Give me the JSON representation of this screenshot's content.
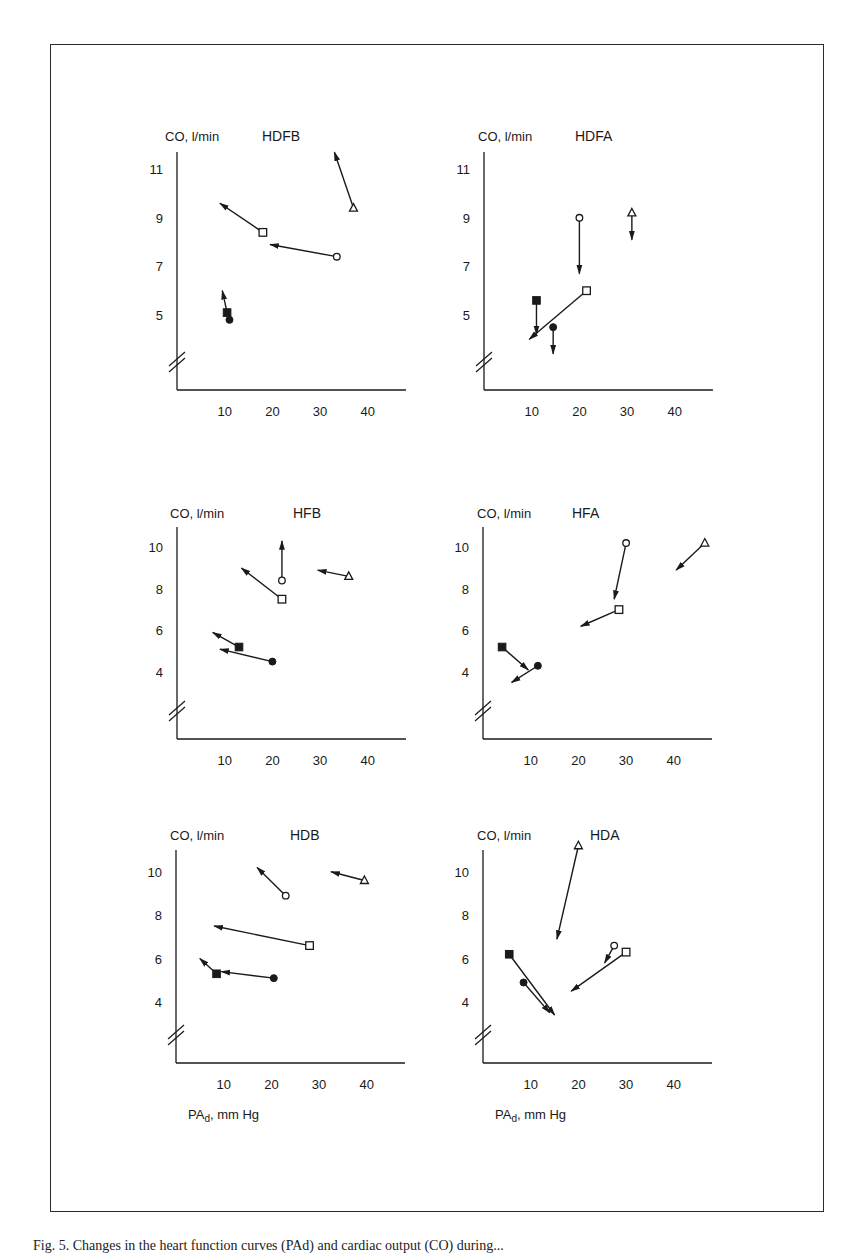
{
  "figure": {
    "caption": "Fig. 5. Changes in the heart function curves (PAd) and cardiac output (CO) during...",
    "y_axis_label": "CO, l/min",
    "x_axis_label": "PAd, mm Hg",
    "x_axis_label_main": "PA",
    "x_axis_label_sub": "d",
    "x_axis_label_unit": ", mm Hg"
  },
  "chart_data": [
    {
      "type": "scatter",
      "title": "HDFB",
      "xlabel": "PAd, mm Hg",
      "ylabel": "CO, l/min",
      "x_ticks": [
        10,
        20,
        30,
        40
      ],
      "y_ticks": [
        5,
        7,
        9,
        11
      ],
      "axis_break": true,
      "series": [
        {
          "marker": "open-triangle",
          "x": 37,
          "y": 9.4,
          "arrow_to": [
            33,
            11.7
          ]
        },
        {
          "marker": "open-square",
          "x": 18,
          "y": 8.4,
          "arrow_to": [
            9,
            9.6
          ]
        },
        {
          "marker": "open-circle",
          "x": 33.5,
          "y": 7.4,
          "arrow_to": [
            19.5,
            7.9
          ]
        },
        {
          "marker": "filled-square",
          "x": 10.5,
          "y": 5.1,
          "arrow_to": [
            9.5,
            6.0
          ]
        },
        {
          "marker": "filled-circle",
          "x": 11,
          "y": 4.8,
          "arrow_to": null
        }
      ]
    },
    {
      "type": "scatter",
      "title": "HDFA",
      "xlabel": "PAd, mm Hg",
      "ylabel": "CO, l/min",
      "x_ticks": [
        10,
        20,
        30,
        40
      ],
      "y_ticks": [
        5,
        7,
        9,
        11
      ],
      "axis_break": true,
      "series": [
        {
          "marker": "open-circle",
          "x": 20,
          "y": 9.0,
          "arrow_to": [
            20,
            6.7
          ]
        },
        {
          "marker": "open-triangle",
          "x": 31,
          "y": 9.2,
          "arrow_to": [
            31,
            8.1
          ]
        },
        {
          "marker": "open-square",
          "x": 21.5,
          "y": 6.0,
          "arrow_to": [
            9.5,
            4.0
          ]
        },
        {
          "marker": "filled-square",
          "x": 11,
          "y": 5.6,
          "arrow_to": [
            11,
            4.2
          ]
        },
        {
          "marker": "filled-circle",
          "x": 14.5,
          "y": 4.5,
          "arrow_to": [
            14.5,
            3.4
          ]
        }
      ]
    },
    {
      "type": "scatter",
      "title": "HFB",
      "xlabel": "PAd, mm Hg",
      "ylabel": "CO, l/min",
      "x_ticks": [
        10,
        20,
        30,
        40
      ],
      "y_ticks": [
        4,
        6,
        8,
        10
      ],
      "axis_break": true,
      "series": [
        {
          "marker": "open-circle",
          "x": 22,
          "y": 8.4,
          "arrow_to": [
            22,
            10.3
          ]
        },
        {
          "marker": "open-triangle",
          "x": 36,
          "y": 8.6,
          "arrow_to": [
            29.5,
            8.9
          ]
        },
        {
          "marker": "open-square",
          "x": 22,
          "y": 7.5,
          "arrow_to": [
            13.5,
            9.0
          ]
        },
        {
          "marker": "filled-square",
          "x": 13,
          "y": 5.2,
          "arrow_to": [
            7.5,
            5.9
          ]
        },
        {
          "marker": "filled-circle",
          "x": 20,
          "y": 4.5,
          "arrow_to": [
            9,
            5.1
          ]
        }
      ]
    },
    {
      "type": "scatter",
      "title": "HFA",
      "xlabel": "PAd, mm Hg",
      "ylabel": "CO, l/min",
      "x_ticks": [
        10,
        20,
        30,
        40
      ],
      "y_ticks": [
        4,
        6,
        8,
        10
      ],
      "axis_break": true,
      "series": [
        {
          "marker": "open-circle",
          "x": 30,
          "y": 10.2,
          "arrow_to": [
            27.5,
            7.5
          ]
        },
        {
          "marker": "open-triangle",
          "x": 46.5,
          "y": 10.2,
          "arrow_to": [
            40.5,
            8.9
          ]
        },
        {
          "marker": "open-square",
          "x": 28.5,
          "y": 7.0,
          "arrow_to": [
            20.5,
            6.2
          ]
        },
        {
          "marker": "filled-square",
          "x": 4,
          "y": 5.2,
          "arrow_to": [
            9.5,
            4.1
          ]
        },
        {
          "marker": "filled-circle",
          "x": 11.5,
          "y": 4.3,
          "arrow_to": [
            6,
            3.5
          ]
        }
      ]
    },
    {
      "type": "scatter",
      "title": "HDB",
      "xlabel": "PAd, mm Hg",
      "ylabel": "CO, l/min",
      "x_ticks": [
        10,
        20,
        30,
        40
      ],
      "y_ticks": [
        4,
        6,
        8,
        10
      ],
      "axis_break": true,
      "series": [
        {
          "marker": "open-circle",
          "x": 23,
          "y": 8.9,
          "arrow_to": [
            17,
            10.2
          ]
        },
        {
          "marker": "open-triangle",
          "x": 39.5,
          "y": 9.6,
          "arrow_to": [
            32.5,
            10.0
          ]
        },
        {
          "marker": "open-square",
          "x": 28,
          "y": 6.6,
          "arrow_to": [
            8,
            7.5
          ]
        },
        {
          "marker": "filled-square",
          "x": 8.5,
          "y": 5.3,
          "arrow_to": [
            5,
            6.0
          ]
        },
        {
          "marker": "filled-circle",
          "x": 20.5,
          "y": 5.1,
          "arrow_to": [
            9.5,
            5.4
          ]
        }
      ]
    },
    {
      "type": "scatter",
      "title": "HDA",
      "xlabel": "PAd, mm Hg",
      "ylabel": "CO, l/min",
      "x_ticks": [
        10,
        20,
        30,
        40
      ],
      "y_ticks": [
        4,
        6,
        8,
        10
      ],
      "axis_break": true,
      "series": [
        {
          "marker": "open-triangle",
          "x": 20,
          "y": 11.2,
          "arrow_to": [
            15.5,
            6.9
          ]
        },
        {
          "marker": "open-circle",
          "x": 27.5,
          "y": 6.6,
          "arrow_to": [
            25.5,
            5.8
          ]
        },
        {
          "marker": "open-square",
          "x": 30,
          "y": 6.3,
          "arrow_to": [
            18.5,
            4.5
          ]
        },
        {
          "marker": "filled-square",
          "x": 5.5,
          "y": 6.2,
          "arrow_to": [
            15,
            3.4
          ]
        },
        {
          "marker": "filled-circle",
          "x": 8.5,
          "y": 4.9,
          "arrow_to": [
            14,
            3.5
          ]
        }
      ]
    }
  ],
  "layout_panels": [
    {
      "x0": 177,
      "axis_y": 390,
      "px_per_x": 4.77,
      "y_ref_val": 5,
      "y_ref_px": 315,
      "px_per_y": 24.3,
      "axis_top": 152,
      "title_x": 262,
      "title_y": 141,
      "ylabel_x": 165,
      "ylabel_y": 141
    },
    {
      "x0": 484,
      "axis_y": 390,
      "px_per_x": 4.77,
      "y_ref_val": 5,
      "y_ref_px": 315,
      "px_per_y": 24.3,
      "axis_top": 152,
      "title_x": 575,
      "title_y": 141,
      "ylabel_x": 478,
      "ylabel_y": 141
    },
    {
      "x0": 177,
      "axis_y": 739,
      "px_per_x": 4.77,
      "y_ref_val": 4,
      "y_ref_px": 672,
      "px_per_y": 20.8,
      "axis_top": 527,
      "title_x": 293,
      "title_y": 518,
      "ylabel_x": 170,
      "ylabel_y": 518
    },
    {
      "x0": 483,
      "axis_y": 739,
      "px_per_x": 4.77,
      "y_ref_val": 4,
      "y_ref_px": 672,
      "px_per_y": 20.8,
      "axis_top": 527,
      "title_x": 572,
      "title_y": 518,
      "ylabel_x": 477,
      "ylabel_y": 518
    },
    {
      "x0": 176,
      "axis_y": 1063,
      "px_per_x": 4.77,
      "y_ref_val": 4,
      "y_ref_px": 1002,
      "px_per_y": 21.7,
      "axis_top": 850,
      "title_x": 290,
      "title_y": 840,
      "ylabel_x": 170,
      "ylabel_y": 840
    },
    {
      "x0": 483,
      "axis_y": 1063,
      "px_per_x": 4.77,
      "y_ref_val": 4,
      "y_ref_px": 1002,
      "px_per_y": 21.7,
      "axis_top": 850,
      "title_x": 590,
      "title_y": 840,
      "ylabel_x": 477,
      "ylabel_y": 840
    }
  ],
  "colors": {
    "ink": "#1a1a1a",
    "frame": "#2a2a2a",
    "background": "#ffffff"
  }
}
